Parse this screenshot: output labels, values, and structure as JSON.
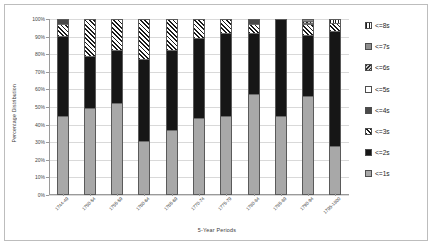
{
  "chart_data": {
    "type": "bar",
    "stacked": true,
    "title": "",
    "xlabel": "5-Year Periods",
    "ylabel": "Percentage Distribution",
    "ylim": [
      0,
      100
    ],
    "ytick_labels": [
      "0%",
      "10%",
      "20%",
      "30%",
      "40%",
      "50%",
      "60%",
      "70%",
      "80%",
      "90%",
      "100%"
    ],
    "ytick_values": [
      0,
      10,
      20,
      30,
      40,
      50,
      60,
      70,
      80,
      90,
      100
    ],
    "grid": true,
    "legend_position": "right",
    "categories": [
      "1744-49",
      "1750-54",
      "1755-59",
      "1760-64",
      "1765-69",
      "1770-74",
      "1775-79",
      "1780-84",
      "1785-89",
      "1790-94",
      "1795-1800"
    ],
    "series": [
      {
        "name": "<=1s",
        "pattern": "light-gray-solid",
        "values": [
          44,
          49,
          52,
          30,
          36,
          43,
          44,
          57,
          44,
          56,
          27
        ]
      },
      {
        "name": "<=2s",
        "pattern": "black-solid",
        "values": [
          46,
          30,
          30,
          47,
          46,
          46,
          48,
          35,
          56,
          35,
          66
        ]
      },
      {
        "name": "<=3s",
        "pattern": "diagonal-hatch",
        "values": [
          7,
          21,
          18,
          23,
          18,
          11,
          8,
          5,
          0,
          6,
          5
        ]
      },
      {
        "name": "<=4s",
        "pattern": "dark-gray-solid",
        "values": [
          3,
          0,
          0,
          0,
          0,
          0,
          0,
          3,
          0,
          1,
          0
        ]
      },
      {
        "name": "<=5s",
        "pattern": "white-empty",
        "values": [
          0,
          0,
          0,
          0,
          0,
          0,
          0,
          0,
          0,
          0,
          0
        ]
      },
      {
        "name": "<=6s",
        "pattern": "speckled",
        "values": [
          0,
          0,
          0,
          0,
          0,
          0,
          0,
          0,
          0,
          1,
          0
        ]
      },
      {
        "name": "<=7s",
        "pattern": "medium-gray-solid",
        "values": [
          0,
          0,
          0,
          0,
          0,
          0,
          0,
          0,
          0,
          1,
          0
        ]
      },
      {
        "name": "<=8s",
        "pattern": "vertical-lines",
        "values": [
          0,
          0,
          0,
          0,
          0,
          0,
          0,
          0,
          0,
          0,
          2
        ]
      }
    ]
  },
  "legend": {
    "items": [
      {
        "label": "<=8s"
      },
      {
        "label": "<=7s"
      },
      {
        "label": "<=6s"
      },
      {
        "label": "<=5s"
      },
      {
        "label": "<=4s"
      },
      {
        "label": "<=3s"
      },
      {
        "label": "<=2s"
      },
      {
        "label": "<=1s"
      }
    ]
  }
}
